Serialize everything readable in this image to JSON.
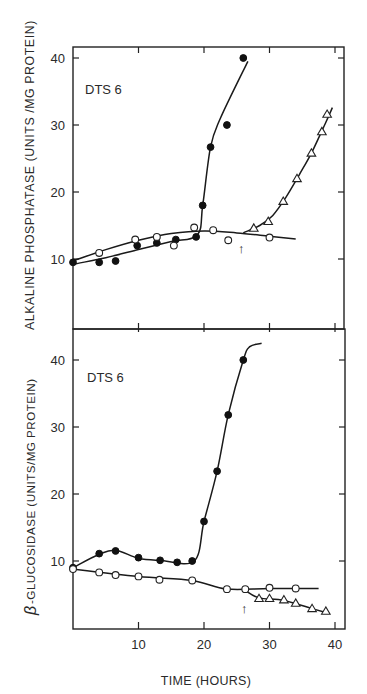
{
  "chart_data": [
    {
      "type": "line",
      "panel": "top",
      "title": "",
      "annotation": "DTS 6",
      "xlabel": "TIME (HOURS)",
      "ylabel": "ALKALINE PHOSPHATASE (UNITS /MG PROTEIN)",
      "xlim": [
        0,
        41
      ],
      "ylim": [
        0,
        42
      ],
      "xticks": [
        10,
        20,
        30,
        40
      ],
      "yticks": [
        10,
        20,
        30,
        40
      ],
      "ytick_labels": [
        "10",
        "20",
        "30",
        "40"
      ],
      "grid": false,
      "legend": "none",
      "arrow_x": 26,
      "series": [
        {
          "name": "filled-circles",
          "marker": "filled-circle",
          "points": [
            [
              0,
              9.5
            ],
            [
              4,
              9.5
            ],
            [
              6.5,
              9.7
            ],
            [
              9.8,
              12.0
            ],
            [
              12.8,
              12.4
            ],
            [
              15.7,
              12.9
            ],
            [
              18.8,
              13.3
            ],
            [
              19.8,
              18.0
            ],
            [
              21.0,
              26.7
            ],
            [
              23.5,
              30.0
            ],
            [
              26.0,
              40.0
            ]
          ],
          "curve": [
            [
              0,
              9.2
            ],
            [
              5,
              10.2
            ],
            [
              10,
              11.4
            ],
            [
              15,
              12.6
            ],
            [
              19,
              13.6
            ],
            [
              19.8,
              18.0
            ],
            [
              21.0,
              26.7
            ],
            [
              22.5,
              31.0
            ],
            [
              26.7,
              39.5
            ]
          ]
        },
        {
          "name": "open-circles",
          "marker": "open-circle",
          "points": [
            [
              4,
              10.9
            ],
            [
              9.5,
              12.9
            ],
            [
              12.8,
              13.3
            ],
            [
              15.4,
              12.0
            ],
            [
              18.5,
              14.7
            ],
            [
              21.4,
              14.3
            ],
            [
              23.7,
              12.8
            ],
            [
              30,
              13.2
            ]
          ],
          "curve": [
            [
              0,
              9.7
            ],
            [
              5,
              11.4
            ],
            [
              10,
              12.8
            ],
            [
              15,
              13.8
            ],
            [
              20,
              14.2
            ],
            [
              25,
              13.9
            ],
            [
              30,
              13.4
            ],
            [
              34,
              13.0
            ]
          ]
        },
        {
          "name": "open-triangles",
          "marker": "open-triangle",
          "points": [
            [
              27.6,
              14.6
            ],
            [
              29.8,
              15.6
            ],
            [
              32.1,
              18.6
            ],
            [
              34.2,
              22.0
            ],
            [
              36.4,
              25.8
            ],
            [
              38.0,
              29.0
            ],
            [
              38.8,
              31.6
            ]
          ],
          "curve": [
            [
              26.0,
              13.9
            ],
            [
              28.5,
              15.0
            ],
            [
              30.5,
              16.5
            ],
            [
              32.5,
              19.2
            ],
            [
              34.5,
              22.5
            ],
            [
              36.5,
              26.0
            ],
            [
              38.5,
              30.2
            ],
            [
              39.6,
              32.6
            ]
          ]
        }
      ]
    },
    {
      "type": "line",
      "panel": "bottom",
      "title": "",
      "annotation": "DTS 6",
      "xlabel": "TIME (HOURS)",
      "ylabel": "β-GLUCOSIDASE (UNITS/MG PROTEIN)",
      "xlim": [
        0,
        41
      ],
      "ylim": [
        0,
        44
      ],
      "xticks": [
        10,
        20,
        30,
        40
      ],
      "xtick_labels": [
        "10",
        "20",
        "30",
        "40"
      ],
      "yticks": [
        10,
        20,
        30,
        40
      ],
      "ytick_labels": [
        "10",
        "20",
        "30",
        "40"
      ],
      "grid": false,
      "legend": "none",
      "arrow_x": 26,
      "series": [
        {
          "name": "filled-circles",
          "marker": "filled-circle",
          "points": [
            [
              0,
              9.0
            ],
            [
              4,
              11.1
            ],
            [
              6.5,
              11.5
            ],
            [
              10,
              10.5
            ],
            [
              13.3,
              10.1
            ],
            [
              15.9,
              9.8
            ],
            [
              18.2,
              10.0
            ],
            [
              20.0,
              15.9
            ],
            [
              22.0,
              23.4
            ],
            [
              23.7,
              31.8
            ],
            [
              26.0,
              40.0
            ]
          ],
          "curve": [
            [
              0,
              9.0
            ],
            [
              4,
              11.0
            ],
            [
              6.5,
              11.6
            ],
            [
              10,
              10.4
            ],
            [
              13.3,
              10.1
            ],
            [
              18.5,
              10.0
            ],
            [
              20.0,
              15.9
            ],
            [
              22.0,
              23.4
            ],
            [
              23.7,
              31.8
            ],
            [
              26.0,
              40.0
            ],
            [
              27.0,
              42.0
            ],
            [
              28.8,
              42.5
            ]
          ]
        },
        {
          "name": "open-circles",
          "marker": "open-circle",
          "points": [
            [
              0,
              8.8
            ],
            [
              4,
              8.3
            ],
            [
              6.5,
              7.9
            ],
            [
              10,
              7.7
            ],
            [
              13.2,
              7.2
            ],
            [
              18.2,
              7.1
            ],
            [
              23.5,
              5.8
            ],
            [
              26.3,
              5.8
            ],
            [
              30,
              6.0
            ],
            [
              34,
              5.9
            ]
          ],
          "curve": [
            [
              0,
              8.8
            ],
            [
              10,
              7.7
            ],
            [
              18.2,
              7.1
            ],
            [
              23.5,
              5.8
            ],
            [
              30,
              5.9
            ],
            [
              37.5,
              5.9
            ]
          ]
        },
        {
          "name": "open-triangles",
          "marker": "open-triangle",
          "points": [
            [
              28.4,
              4.4
            ],
            [
              30.0,
              4.4
            ],
            [
              32.2,
              4.2
            ],
            [
              34.0,
              3.7
            ],
            [
              36.5,
              2.9
            ],
            [
              38.6,
              2.5
            ]
          ],
          "curve": [
            [
              26.3,
              5.6
            ],
            [
              28.4,
              4.5
            ],
            [
              32.2,
              4.1
            ],
            [
              36.5,
              2.9
            ],
            [
              39.0,
              2.2
            ]
          ]
        }
      ]
    }
  ],
  "figure": {
    "top_panel_label": "DTS 6",
    "bottom_panel_label": "DTS 6",
    "top_ylabel": "ALKALINE PHOSPHATASE (UNITS /MG PROTEIN)",
    "bottom_ylabel_greek": "β",
    "bottom_ylabel": "-GLUCOSIDASE (UNITS/MG PROTEIN)",
    "xlabel": "TIME (HOURS)",
    "arrow_glyph": "↑"
  }
}
